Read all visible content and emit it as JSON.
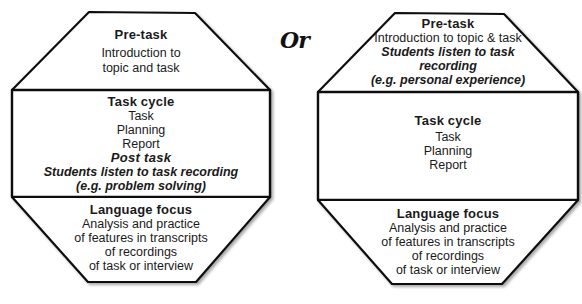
{
  "connector": "Or",
  "left": {
    "pretask": {
      "heading": "Pre-task",
      "lines": [
        "Introduction to",
        "topic and task"
      ]
    },
    "taskcycle": {
      "heading": "Task cycle",
      "lines": [
        "Task",
        "Planning",
        "Report"
      ],
      "post_heading": "Post task",
      "post_lines": [
        "Students listen to task recording",
        "(e.g. problem solving)"
      ]
    },
    "language": {
      "heading": "Language focus",
      "lines": [
        "Analysis and practice",
        "of features in transcripts",
        "of recordings",
        "of task or interview"
      ]
    }
  },
  "right": {
    "pretask": {
      "heading": "Pre-task",
      "lines": [
        "Introduction to topic & task"
      ],
      "italic_lines": [
        "Students listen to task",
        "recording",
        "(e.g. personal experience)"
      ]
    },
    "taskcycle": {
      "heading": "Task cycle",
      "lines": [
        "Task",
        "Planning",
        "Report"
      ]
    },
    "language": {
      "heading": "Language focus",
      "lines": [
        "Analysis and practice",
        "of features in transcripts",
        "of recordings",
        "of task or interview"
      ]
    }
  }
}
